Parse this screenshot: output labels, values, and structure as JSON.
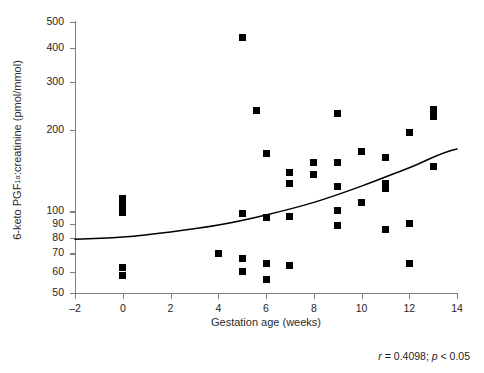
{
  "chart_data": {
    "type": "scatter",
    "title": "",
    "xlabel": "Gestation age (weeks)",
    "ylabel": "6-keto PGF1α:creatinine (pmol/mmol)",
    "ylabel_parts": {
      "pre": "6-keto PGF",
      "sub": "1α",
      "post": ":creatinine (pmol/mmol)"
    },
    "xlim": [
      -2,
      14
    ],
    "ylim": [
      50,
      500
    ],
    "yscale": "log",
    "xscale": "linear",
    "grid": false,
    "legend": null,
    "xticks": [
      -2,
      0,
      2,
      4,
      6,
      8,
      10,
      12,
      14
    ],
    "xticklabels": [
      "–2",
      "0",
      "2",
      "4",
      "6",
      "8",
      "10",
      "12",
      "14"
    ],
    "yticks": [
      50,
      60,
      70,
      80,
      90,
      100,
      200,
      300,
      400,
      500
    ],
    "yticklabels": [
      "50",
      "60",
      "70",
      "80",
      "90",
      "100",
      "200",
      "300",
      "400",
      "500"
    ],
    "marker": "square",
    "marker_color": "#000000",
    "marker_size": 7,
    "points": [
      {
        "x": 0,
        "y": 112
      },
      {
        "x": 0,
        "y": 105
      },
      {
        "x": 0,
        "y": 99
      },
      {
        "x": 0,
        "y": 62
      },
      {
        "x": 0,
        "y": 58
      },
      {
        "x": 4,
        "y": 70
      },
      {
        "x": 5,
        "y": 440
      },
      {
        "x": 5,
        "y": 98
      },
      {
        "x": 5,
        "y": 67
      },
      {
        "x": 5,
        "y": 60
      },
      {
        "x": 5.6,
        "y": 235
      },
      {
        "x": 6,
        "y": 163
      },
      {
        "x": 6,
        "y": 95
      },
      {
        "x": 6,
        "y": 64
      },
      {
        "x": 6,
        "y": 56
      },
      {
        "x": 7,
        "y": 139
      },
      {
        "x": 7,
        "y": 127
      },
      {
        "x": 7,
        "y": 96
      },
      {
        "x": 7,
        "y": 63
      },
      {
        "x": 8,
        "y": 152
      },
      {
        "x": 8,
        "y": 137
      },
      {
        "x": 9,
        "y": 230
      },
      {
        "x": 9,
        "y": 151
      },
      {
        "x": 9,
        "y": 124
      },
      {
        "x": 9,
        "y": 101
      },
      {
        "x": 9,
        "y": 89
      },
      {
        "x": 10,
        "y": 166
      },
      {
        "x": 10,
        "y": 108
      },
      {
        "x": 11,
        "y": 158
      },
      {
        "x": 11,
        "y": 127
      },
      {
        "x": 11,
        "y": 122
      },
      {
        "x": 11,
        "y": 86
      },
      {
        "x": 12,
        "y": 196
      },
      {
        "x": 12,
        "y": 90
      },
      {
        "x": 12,
        "y": 64
      },
      {
        "x": 13,
        "y": 237
      },
      {
        "x": 13,
        "y": 224
      },
      {
        "x": 13,
        "y": 146
      }
    ],
    "fit_curve": {
      "type": "exponential-regression",
      "description": "monotonically increasing fitted trend line",
      "points": [
        {
          "x": -2,
          "y": 79
        },
        {
          "x": 0,
          "y": 80.5
        },
        {
          "x": 2,
          "y": 84
        },
        {
          "x": 4,
          "y": 89
        },
        {
          "x": 6,
          "y": 97
        },
        {
          "x": 8,
          "y": 108
        },
        {
          "x": 10,
          "y": 124
        },
        {
          "x": 12,
          "y": 145
        },
        {
          "x": 14,
          "y": 170
        }
      ],
      "color": "#000000"
    }
  },
  "caption": {
    "r_symbol": "r",
    "r_text": " = 0.4098; ",
    "p_symbol": "p",
    "p_text": " < 0.05",
    "full": "r = 0.4098; p < 0.05"
  },
  "colors": {
    "axis": "#7d7d7d",
    "text": "#1e1e1e",
    "marker": "#000000",
    "background": "#ffffff"
  }
}
